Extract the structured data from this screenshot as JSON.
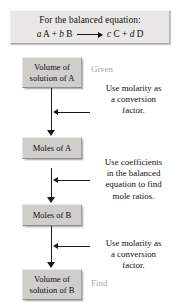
{
  "header": {
    "caption": "For the balanced equation:",
    "equation": {
      "left": [
        {
          "coefficient": "a",
          "species": "A"
        },
        {
          "coefficient": "b",
          "species": "B"
        }
      ],
      "right": [
        {
          "coefficient": "c",
          "species": "C"
        },
        {
          "coefficient": "d",
          "species": "D"
        }
      ],
      "plus": "+",
      "arrow": "reaction-arrow",
      "plain_text": "a A + b B ⟶ c C + d D"
    }
  },
  "flow": {
    "boxes": [
      {
        "id": "volume-solution-a",
        "lines": [
          "Volume of",
          "solution of A"
        ]
      },
      {
        "id": "moles-a",
        "lines": [
          "Moles of A"
        ]
      },
      {
        "id": "moles-b",
        "lines": [
          "Moles of B"
        ]
      },
      {
        "id": "volume-solution-b",
        "lines": [
          "Volume of",
          "solution of B"
        ]
      }
    ],
    "side_labels": {
      "given": "Given",
      "find": "Find"
    },
    "notes": [
      {
        "id": "note-molarity-1",
        "lines": [
          "Use molarity as",
          "a conversion",
          "factor."
        ]
      },
      {
        "id": "note-coefficients",
        "lines": [
          "Use coefficients",
          "in the balanced",
          "equation to find",
          "mole ratios."
        ]
      },
      {
        "id": "note-molarity-2",
        "lines": [
          "Use molarity as",
          "a conversion",
          "factor."
        ]
      }
    ]
  },
  "colors": {
    "box_fill": "#cfcecb",
    "header_fill": "#e9e8e6",
    "text": "#110f0e",
    "muted_text": "#a9a7a4",
    "arrow": "#1b1a19",
    "background": "#ffffff"
  }
}
